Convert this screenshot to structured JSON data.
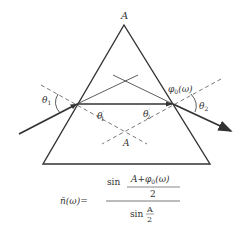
{
  "diagram": {
    "labels": {
      "apex": "A",
      "apex_lower": "A",
      "theta1": "θ",
      "theta1_sub": "1",
      "theta2": "θ",
      "theta2_sub": "2",
      "theta1p": "θ",
      "theta1p_sub": "1",
      "theta1p_sup": "′",
      "theta2p": "θ",
      "theta2p_sub": "2",
      "theta2p_sup": "′",
      "phi": "φ",
      "phi_sub": "0",
      "phi_arg": "(ω)"
    },
    "formula": {
      "lhs": "n̄(ω)=",
      "num_sin": "sin",
      "num_top": "A+φ",
      "num_top_sub": "0",
      "num_top_arg": "(ω)",
      "num_bottom": "2",
      "den_sin": "sin",
      "den_top": "A",
      "den_bottom": "2"
    },
    "colors": {
      "line": "#333333",
      "dashed": "#555555",
      "background": "#ffffff"
    }
  }
}
